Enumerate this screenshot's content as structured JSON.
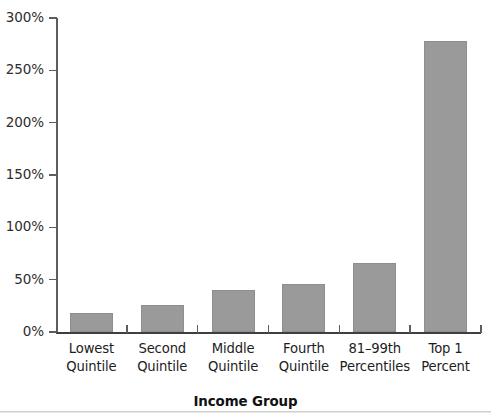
{
  "chart_data": {
    "type": "bar",
    "title": "",
    "xlabel": "Income Group",
    "ylabel": "",
    "categories": [
      "Lowest Quintile",
      "Second Quintile",
      "Middle Quintile",
      "Fourth Quintile",
      "81–99th Percentiles",
      "Top 1 Percent"
    ],
    "category_lines": [
      [
        "Lowest",
        "Quintile"
      ],
      [
        "Second",
        "Quintile"
      ],
      [
        "Middle",
        "Quintile"
      ],
      [
        "Fourth",
        "Quintile"
      ],
      [
        "81–99th",
        "Percentiles"
      ],
      [
        "Top 1",
        "Percent"
      ]
    ],
    "values": [
      18,
      26,
      40,
      46,
      66,
      278
    ],
    "value_labels": [
      "18%",
      "26%",
      "40%",
      "46%",
      "66%",
      "278%"
    ],
    "ylim": [
      0,
      300
    ],
    "ytick_values": [
      0,
      50,
      100,
      150,
      200,
      250,
      300
    ],
    "ytick_labels": [
      "0%",
      "50%",
      "100%",
      "150%",
      "200%",
      "250%",
      "300%"
    ],
    "grid": false,
    "legend": null,
    "bar_color": "#9a9a9a",
    "axis_color": "#3f3f3f",
    "text_color": "#1d1d1d"
  }
}
